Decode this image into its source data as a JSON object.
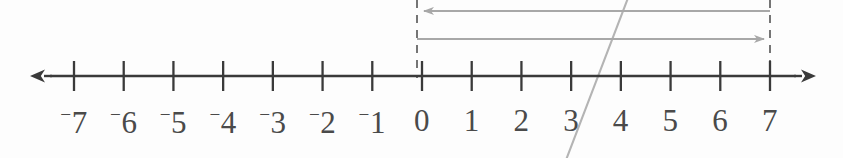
{
  "figure": {
    "title": "Number line from negative seven to seven with two span arrows",
    "background_color": "#fdfdfd",
    "axis_color": "#3a3a3a",
    "tick_color": "#3a3a3a",
    "label_color": "#4a4a4a",
    "annotation_color": "#a8a8a8",
    "stray_mark_color": "#b4b4b4"
  },
  "chart_data": {
    "type": "line",
    "title": "",
    "xlabel": "",
    "ylabel": "",
    "orientation": "horizontal",
    "axis_kind": "number-line",
    "xlim": [
      -7.8,
      7.8
    ],
    "grid": false,
    "legend": null,
    "tick_values": [
      -7,
      -6,
      -5,
      -4,
      -3,
      -2,
      -1,
      0,
      1,
      2,
      3,
      4,
      5,
      6,
      7
    ],
    "tick_labels": [
      "⁻7",
      "⁻6",
      "⁻5",
      "⁻4",
      "⁻3",
      "⁻2",
      "⁻1",
      "0",
      "1",
      "2",
      "3",
      "4",
      "5",
      "6",
      "7"
    ],
    "tick_label_texts": [
      "-7",
      "-6",
      "-5",
      "-4",
      "-3",
      "-2",
      "-1",
      "0",
      "1",
      "2",
      "3",
      "4",
      "5",
      "6",
      "7"
    ],
    "negative_sign_style": "raised-superscript-minus",
    "tick_spacing_px": 49.8,
    "axis_arrowheads": [
      "left",
      "right"
    ],
    "annotations": [
      {
        "id": "span-arrow-upper",
        "kind": "span-arrow",
        "from": 7,
        "to": 0,
        "direction": "left",
        "arrowhead_at": 0,
        "y_px": 11,
        "color": "#a8a8a8",
        "label": ""
      },
      {
        "id": "span-arrow-lower",
        "kind": "span-arrow",
        "from": 0,
        "to": 7,
        "direction": "right",
        "arrowhead_at": 7,
        "y_px": 39,
        "color": "#a8a8a8",
        "label": ""
      },
      {
        "id": "dashed-guide-zero",
        "kind": "dashed-vertical",
        "at": 0,
        "y_top_px": 0,
        "y_bottom_px": 76,
        "color": "#7a7a7a",
        "label": ""
      },
      {
        "id": "dashed-guide-seven",
        "kind": "dashed-vertical",
        "at": 7,
        "y_top_px": 0,
        "y_bottom_px": 76,
        "color": "#7a7a7a",
        "label": ""
      },
      {
        "id": "stray-diagonal-mark",
        "kind": "stray-pencil-stroke",
        "from_px": [
          566,
          158
        ],
        "to_px": [
          628,
          0
        ],
        "color": "#b4b4b4",
        "label": ""
      }
    ]
  },
  "geometry": {
    "width": 843,
    "height": 158,
    "axis_y": 76,
    "x_at_minus7": 74,
    "x_at_zero": 417,
    "x_at_seven": 770,
    "axis_left_tip": 36,
    "axis_right_tip": 810,
    "tick_top": 61,
    "tick_bottom": 91,
    "label_top": 105
  }
}
